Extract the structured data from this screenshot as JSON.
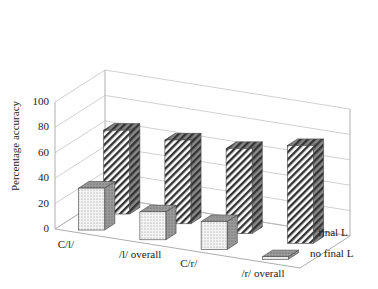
{
  "chart_data": {
    "type": "bar",
    "subtype": "3d-grouped",
    "title": "",
    "xlabel": "",
    "ylabel": "Percentage accuracy",
    "ylim": [
      0,
      100
    ],
    "yticks": [
      0,
      20,
      40,
      60,
      80,
      100
    ],
    "grid": true,
    "categories": [
      "C/l/",
      "/l/ overall",
      "C/r/",
      "/r/ overall"
    ],
    "series": [
      {
        "name": "no final L",
        "pattern": "dotted",
        "values": [
          33,
          22,
          22,
          2
        ]
      },
      {
        "name": "final L",
        "pattern": "diagonal-hatch",
        "values": [
          66,
          66,
          67,
          77
        ]
      }
    ],
    "legend_position": "depth-axis-right"
  }
}
